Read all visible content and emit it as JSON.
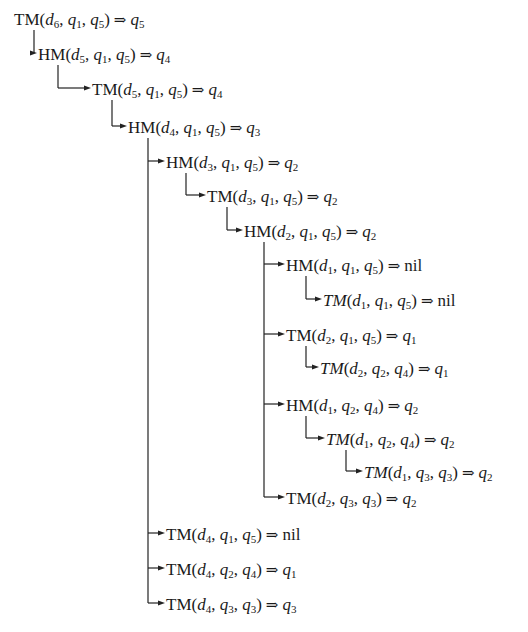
{
  "diagram": {
    "type": "recursion-tree",
    "nodes": [
      {
        "id": 0,
        "fn": "TM",
        "italic": false,
        "d": "6",
        "a": [
          "1",
          "5"
        ],
        "result": "q5",
        "x": 14,
        "y": 22,
        "parent": null
      },
      {
        "id": 1,
        "fn": "HM",
        "italic": false,
        "d": "5",
        "a": [
          "1",
          "5"
        ],
        "result": "q4",
        "x": 38,
        "y": 57,
        "parent": 0
      },
      {
        "id": 2,
        "fn": "TM",
        "italic": false,
        "d": "5",
        "a": [
          "1",
          "5"
        ],
        "result": "q4",
        "x": 92,
        "y": 92,
        "parent": 1
      },
      {
        "id": 3,
        "fn": "HM",
        "italic": false,
        "d": "4",
        "a": [
          "1",
          "5"
        ],
        "result": "q3",
        "x": 128,
        "y": 130,
        "parent": 2
      },
      {
        "id": 4,
        "fn": "HM",
        "italic": false,
        "d": "3",
        "a": [
          "1",
          "5"
        ],
        "result": "q2",
        "x": 166,
        "y": 165,
        "parent": 3
      },
      {
        "id": 5,
        "fn": "TM",
        "italic": false,
        "d": "3",
        "a": [
          "1",
          "5"
        ],
        "result": "q2",
        "x": 207,
        "y": 199,
        "parent": 4
      },
      {
        "id": 6,
        "fn": "HM",
        "italic": false,
        "d": "2",
        "a": [
          "1",
          "5"
        ],
        "result": "q2",
        "x": 244,
        "y": 234,
        "parent": 5
      },
      {
        "id": 7,
        "fn": "HM",
        "italic": false,
        "d": "1",
        "a": [
          "1",
          "5"
        ],
        "result": "nil",
        "x": 286,
        "y": 268,
        "parent": 6
      },
      {
        "id": 8,
        "fn": "TM",
        "italic": true,
        "d": "1",
        "a": [
          "1",
          "5"
        ],
        "result": "nil",
        "x": 323,
        "y": 303,
        "parent": 7
      },
      {
        "id": 9,
        "fn": "TM",
        "italic": false,
        "d": "2",
        "a": [
          "1",
          "5"
        ],
        "result": "q1",
        "x": 286,
        "y": 338,
        "parent": 6
      },
      {
        "id": 10,
        "fn": "TM",
        "italic": true,
        "d": "2",
        "a": [
          "2",
          "4"
        ],
        "result": "q1",
        "x": 320,
        "y": 371,
        "parent": 9
      },
      {
        "id": 11,
        "fn": "HM",
        "italic": false,
        "d": "1",
        "a": [
          "2",
          "4"
        ],
        "result": "q2",
        "x": 286,
        "y": 408,
        "parent": 6
      },
      {
        "id": 12,
        "fn": "TM",
        "italic": true,
        "d": "1",
        "a": [
          "2",
          "4"
        ],
        "result": "q2",
        "x": 326,
        "y": 442,
        "parent": 11
      },
      {
        "id": 13,
        "fn": "TM",
        "italic": true,
        "d": "1",
        "a": [
          "3",
          "3"
        ],
        "result": "q2",
        "x": 364,
        "y": 475,
        "parent": 12
      },
      {
        "id": 14,
        "fn": "TM",
        "italic": false,
        "d": "2",
        "a": [
          "3",
          "3"
        ],
        "result": "q2",
        "x": 286,
        "y": 501,
        "parent": 6
      },
      {
        "id": 15,
        "fn": "TM",
        "italic": false,
        "d": "4",
        "a": [
          "1",
          "5"
        ],
        "result": "nil",
        "x": 166,
        "y": 537,
        "parent": 3
      },
      {
        "id": 16,
        "fn": "TM",
        "italic": false,
        "d": "4",
        "a": [
          "2",
          "4"
        ],
        "result": "q1",
        "x": 166,
        "y": 572,
        "parent": 3
      },
      {
        "id": 17,
        "fn": "TM",
        "italic": false,
        "d": "4",
        "a": [
          "3",
          "3"
        ],
        "result": "q3",
        "x": 166,
        "y": 607,
        "parent": 3
      }
    ],
    "labels": [
      "TM(d6, q1, q5) ⇒ q5",
      "HM(d5, q1, q5) ⇒ q4",
      "TM(d5, q1, q5) ⇒ q4",
      "HM(d4, q1, q5) ⇒ q3",
      "HM(d3, q1, q5) ⇒ q2",
      "TM(d3, q1, q5) ⇒ q2",
      "HM(d2, q1, q5) ⇒ q2",
      "HM(d1, q1, q5) ⇒ nil",
      "TM(d1, q1, q5) ⇒ nil",
      "TM(d2, q1, q5) ⇒ q1",
      "TM(d2, q2, q4) ⇒ q1",
      "HM(d1, q2, q4) ⇒ q2",
      "TM(d1, q2, q4) ⇒ q2",
      "TM(d1, q3, q3) ⇒ q2",
      "TM(d2, q3, q3) ⇒ q2",
      "TM(d4, q1, q5) ⇒ nil",
      "TM(d4, q2, q4) ⇒ q1",
      "TM(d4, q3, q3) ⇒ q3"
    ],
    "symbols": {
      "implies": "⇒",
      "nil": "nil",
      "d": "d",
      "q": "q"
    },
    "colors": {
      "line": "#222222",
      "text": "#1a1a1a",
      "background": "#ffffff"
    }
  }
}
